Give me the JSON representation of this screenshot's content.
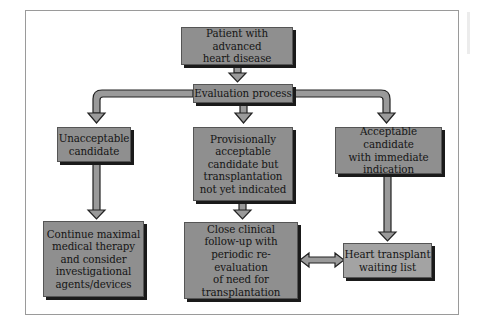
{
  "diagram": {
    "type": "flowchart",
    "colors": {
      "box_fill": "#8f8f8f",
      "box_fill_light": "#a3a3a3",
      "arrow_fill": "#9a9a9a",
      "shadow": "#1a1a1a",
      "frame": "#9a9a9a"
    },
    "nodes": {
      "start": "Patient with advanced\nheart disease",
      "evaluation": "Evaluation process",
      "unacceptable": "Unacceptable\ncandidate",
      "provisional": "Provisionally\nacceptable\ncandidate but\ntransplantation\nnot yet indicated",
      "acceptable": "Acceptable candidate\nwith immediate\nindication",
      "continue_therapy": "Continue maximal\nmedical therapy\nand consider\ninvestigational\nagents/devices",
      "follow_up": "Close clinical\nfollow-up with\nperiodic re-evaluation\nof need for\ntransplantation",
      "waiting_list": "Heart transplant\nwaiting list"
    },
    "edges": [
      {
        "from": "start",
        "to": "evaluation",
        "type": "arrow"
      },
      {
        "from": "evaluation",
        "to": "unacceptable",
        "type": "arrow"
      },
      {
        "from": "evaluation",
        "to": "provisional",
        "type": "arrow"
      },
      {
        "from": "evaluation",
        "to": "acceptable",
        "type": "arrow"
      },
      {
        "from": "unacceptable",
        "to": "continue_therapy",
        "type": "arrow"
      },
      {
        "from": "provisional",
        "to": "follow_up",
        "type": "arrow"
      },
      {
        "from": "acceptable",
        "to": "waiting_list",
        "type": "arrow"
      },
      {
        "from": "follow_up",
        "to": "waiting_list",
        "type": "bidirectional"
      }
    ]
  }
}
